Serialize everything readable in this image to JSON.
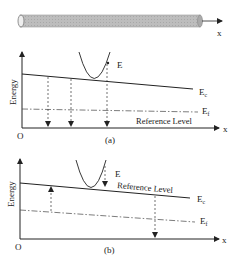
{
  "rod": {
    "axis_label": "x",
    "fill": "#b8b8b8"
  },
  "panel_a": {
    "y_axis_label": "Energy",
    "origin_label": "O",
    "x_axis_label": "x",
    "ec_label": "E",
    "ec_sub": "c",
    "ef_label": "E",
    "ef_sub": "f",
    "e_label": "E",
    "reference_label": "Reference Level",
    "caption": "(a)"
  },
  "panel_b": {
    "y_axis_label": "Energy",
    "origin_label": "O",
    "x_axis_label": "x",
    "ec_label": "E",
    "ec_sub": "c",
    "ef_label": "E",
    "ef_sub": "f",
    "e_label": "E",
    "reference_label": "Reference Level",
    "caption": "(b)"
  },
  "colors": {
    "line": "#222222",
    "rod": "#b8b8b8",
    "rod_edge": "#888888"
  }
}
